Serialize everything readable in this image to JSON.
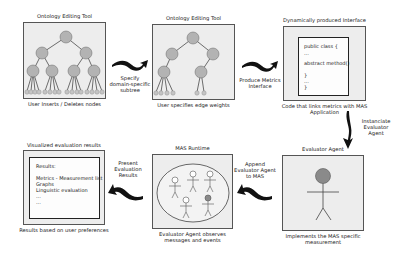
{
  "steps": {
    "ontology1": {
      "title": "Ontology Editing Tool",
      "caption": "User Inserts / Deletes nodes"
    },
    "ontology2": {
      "title": "Ontology Editing Tool",
      "caption": "User specifies edge weights"
    },
    "interface": {
      "title": "Dynamically produced Interface",
      "caption_line1": "Code that links metrics with MAS",
      "caption_line2": "Application",
      "code_lines": [
        "public class {",
        "...",
        "",
        "abstract method()",
        "",
        "}",
        "...",
        "}"
      ]
    },
    "evaluator": {
      "title": "Evaluator Agent",
      "caption_line1": "Implements the MAS specific",
      "caption_line2": "measurement"
    },
    "runtime": {
      "title": "MAS Runtime",
      "caption_line1": "Evaluator Agent observes",
      "caption_line2": "messages and events"
    },
    "results": {
      "title": "Visualized evaluation results",
      "caption": "Results based on user preferences",
      "content_lines": [
        "Results:",
        "",
        "Metrics - Measurement list",
        "Graphs",
        "Linguistic evaluation",
        "...",
        "..."
      ]
    }
  },
  "arrows": {
    "a1": [
      "Specify",
      "domain-specific",
      "subtree"
    ],
    "a2": [
      "Produce Metrics",
      "Interface"
    ],
    "a3": [
      "Instanciate",
      "Evaluator",
      "Agent"
    ],
    "a4": [
      "Append",
      "Evaluator Agent",
      "to MAS"
    ],
    "a5": [
      "Present",
      "Evaluation",
      "Results"
    ]
  },
  "colors": {
    "panel_bg": "#ededed",
    "node_fill": "#b3b3b3",
    "agent_highlight": "#8a8a8a",
    "arrow": "#111111"
  }
}
